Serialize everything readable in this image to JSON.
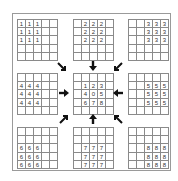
{
  "diagram": {
    "grids": [
      {
        "id": "g1",
        "label": "1",
        "cells": [
          [
            "1",
            "1",
            "1",
            "",
            ""
          ],
          [
            "1",
            "1",
            "1",
            "",
            ""
          ],
          [
            "1",
            "1",
            "1",
            "",
            ""
          ],
          [
            "",
            "",
            "",
            "",
            ""
          ],
          [
            "",
            "",
            "",
            "",
            ""
          ]
        ]
      },
      {
        "id": "g2",
        "label": "2",
        "cells": [
          [
            "",
            "2",
            "2",
            "2",
            ""
          ],
          [
            "",
            "2",
            "2",
            "2",
            ""
          ],
          [
            "",
            "2",
            "2",
            "2",
            ""
          ],
          [
            "",
            "",
            "",
            "",
            ""
          ],
          [
            "",
            "",
            "",
            "",
            ""
          ]
        ]
      },
      {
        "id": "g3",
        "label": "3",
        "cells": [
          [
            "",
            "",
            "3",
            "3",
            "3"
          ],
          [
            "",
            "",
            "3",
            "3",
            "3"
          ],
          [
            "",
            "",
            "3",
            "3",
            "3"
          ],
          [
            "",
            "",
            "",
            "",
            ""
          ],
          [
            "",
            "",
            "",
            "",
            ""
          ]
        ]
      },
      {
        "id": "g4",
        "label": "4",
        "cells": [
          [
            "",
            "",
            "",
            "",
            ""
          ],
          [
            "4",
            "4",
            "4",
            "",
            ""
          ],
          [
            "4",
            "4",
            "4",
            "",
            ""
          ],
          [
            "4",
            "4",
            "4",
            "",
            ""
          ],
          [
            "",
            "",
            "",
            "",
            ""
          ]
        ]
      },
      {
        "id": "center",
        "label": "center",
        "cells": [
          [
            "",
            "",
            "",
            "",
            ""
          ],
          [
            "",
            "1",
            "2",
            "3",
            ""
          ],
          [
            "",
            "4",
            "0",
            "5",
            ""
          ],
          [
            "",
            "6",
            "7",
            "8",
            ""
          ],
          [
            "",
            "",
            "",
            "",
            ""
          ]
        ]
      },
      {
        "id": "g5",
        "label": "5",
        "cells": [
          [
            "",
            "",
            "",
            "",
            ""
          ],
          [
            "",
            "",
            "5",
            "5",
            "5"
          ],
          [
            "",
            "",
            "5",
            "5",
            "5"
          ],
          [
            "",
            "",
            "5",
            "5",
            "5"
          ],
          [
            "",
            "",
            "",
            "",
            ""
          ]
        ]
      },
      {
        "id": "g6",
        "label": "6",
        "cells": [
          [
            "",
            "",
            "",
            "",
            ""
          ],
          [
            "",
            "",
            "",
            "",
            ""
          ],
          [
            "6",
            "6",
            "6",
            "",
            ""
          ],
          [
            "6",
            "6",
            "6",
            "",
            ""
          ],
          [
            "6",
            "6",
            "6",
            "",
            ""
          ]
        ]
      },
      {
        "id": "g7",
        "label": "7",
        "cells": [
          [
            "",
            "",
            "",
            "",
            ""
          ],
          [
            "",
            "",
            "",
            "",
            ""
          ],
          [
            "",
            "7",
            "7",
            "7",
            ""
          ],
          [
            "",
            "7",
            "7",
            "7",
            ""
          ],
          [
            "",
            "7",
            "7",
            "7",
            ""
          ]
        ]
      },
      {
        "id": "g8",
        "label": "8",
        "cells": [
          [
            "",
            "",
            "",
            "",
            ""
          ],
          [
            "",
            "",
            "",
            "",
            ""
          ],
          [
            "",
            "",
            "8",
            "8",
            "8"
          ],
          [
            "",
            "",
            "8",
            "8",
            "8"
          ],
          [
            "",
            "",
            "8",
            "8",
            "8"
          ]
        ]
      }
    ],
    "arrows": [
      "down-right",
      "down",
      "down-left",
      "right",
      "left",
      "up-right",
      "up",
      "up-left"
    ],
    "colors": {
      "line": "#8a8a8a",
      "frame": "#9a9a9a",
      "arrow": "#111111",
      "text": "#333333"
    }
  }
}
